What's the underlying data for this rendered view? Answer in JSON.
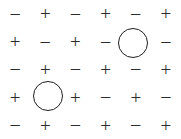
{
  "figure": {
    "background_color": "#ffffff",
    "glyph_color": "#2b2b2b",
    "marker_color": "#1f1f1f",
    "rows": 5,
    "columns": 6,
    "plus_symbol": "+",
    "minus_symbol": "−"
  },
  "grid": {
    "cells": [
      [
        {
          "symbol": "−",
          "kind": "minus",
          "circled": false
        },
        {
          "symbol": "+",
          "kind": "plus",
          "circled": false
        },
        {
          "symbol": "−",
          "kind": "minus",
          "circled": false
        },
        {
          "symbol": "+",
          "kind": "plus",
          "circled": false
        },
        {
          "symbol": "−",
          "kind": "minus",
          "circled": false
        },
        {
          "symbol": "+",
          "kind": "plus",
          "circled": false
        }
      ],
      [
        {
          "symbol": "+",
          "kind": "plus",
          "circled": false
        },
        {
          "symbol": "−",
          "kind": "minus",
          "circled": false
        },
        {
          "symbol": "+",
          "kind": "plus",
          "circled": false
        },
        {
          "symbol": "−",
          "kind": "minus",
          "circled": false
        },
        {
          "symbol": "",
          "kind": "circle",
          "circled": true
        },
        {
          "symbol": "−",
          "kind": "minus",
          "circled": false
        }
      ],
      [
        {
          "symbol": "−",
          "kind": "minus",
          "circled": false
        },
        {
          "symbol": "+",
          "kind": "plus",
          "circled": false
        },
        {
          "symbol": "−",
          "kind": "minus",
          "circled": false
        },
        {
          "symbol": "+",
          "kind": "plus",
          "circled": false
        },
        {
          "symbol": "−",
          "kind": "minus",
          "circled": false
        },
        {
          "symbol": "+",
          "kind": "plus",
          "circled": false
        }
      ],
      [
        {
          "symbol": "+",
          "kind": "plus",
          "circled": false
        },
        {
          "symbol": "",
          "kind": "circle",
          "circled": true
        },
        {
          "symbol": "+",
          "kind": "plus",
          "circled": false
        },
        {
          "symbol": "−",
          "kind": "minus",
          "circled": false
        },
        {
          "symbol": "+",
          "kind": "plus",
          "circled": false
        },
        {
          "symbol": "−",
          "kind": "minus",
          "circled": false
        }
      ],
      [
        {
          "symbol": "−",
          "kind": "minus",
          "circled": false
        },
        {
          "symbol": "+",
          "kind": "plus",
          "circled": false
        },
        {
          "symbol": "−",
          "kind": "minus",
          "circled": false
        },
        {
          "symbol": "+",
          "kind": "plus",
          "circled": false
        },
        {
          "symbol": "−",
          "kind": "minus",
          "circled": false
        },
        {
          "symbol": "+",
          "kind": "plus",
          "circled": false
        }
      ]
    ]
  },
  "markers": {
    "circles": [
      {
        "label": "circle-row2-col5",
        "row": 2,
        "column": 5,
        "center_x": 133,
        "center_y": 43,
        "diameter": 30
      },
      {
        "label": "circle-row4-col2",
        "row": 4,
        "column": 2,
        "center_x": 48,
        "center_y": 96,
        "diameter": 30
      }
    ]
  }
}
